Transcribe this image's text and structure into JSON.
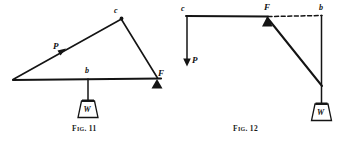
{
  "page": {
    "width": 351,
    "height": 141,
    "background": "#ffffff",
    "ink": "#111111"
  },
  "figures": [
    {
      "id": "fig-11",
      "caption_prefix": "F",
      "caption_ig": "IG",
      "caption_number": ". 11",
      "caption_full": "FIG. 11",
      "labels": {
        "apex": "c",
        "force": "P",
        "mid": "b",
        "fulcrum": "F",
        "weight": "W"
      },
      "geometry": {
        "left_vertex": [
          13,
          80
        ],
        "apex": [
          121,
          18
        ],
        "fulcrum": [
          157,
          78
        ],
        "baseline_start": [
          13,
          80
        ],
        "baseline_end": [
          160,
          79
        ],
        "mid_point": [
          88,
          79
        ],
        "weight_top": [
          88,
          100
        ],
        "weight_box": {
          "x": 78,
          "y": 100,
          "w": 21,
          "h": 18
        }
      }
    },
    {
      "id": "fig-12",
      "caption_prefix": "F",
      "caption_ig": "IG",
      "caption_number": ". 12",
      "caption_full": "FIG. 12",
      "labels": {
        "left_top": "c",
        "force": "P",
        "fulcrum": "F",
        "right_top": "b",
        "weight": "W"
      },
      "geometry": {
        "top_left": [
          10,
          16
        ],
        "fulcrum": [
          91,
          17
        ],
        "top_right": [
          145,
          15
        ],
        "force_arrow_end": [
          11,
          64
        ],
        "diagonal_end": [
          146,
          86
        ],
        "weight_box": {
          "x": 134,
          "y": 103,
          "w": 22,
          "h": 18
        }
      }
    }
  ]
}
